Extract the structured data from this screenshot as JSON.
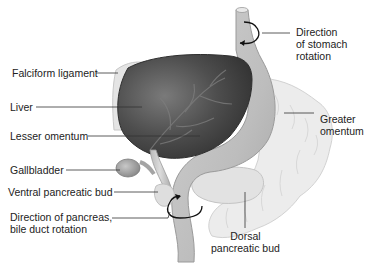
{
  "diagram": {
    "colors": {
      "liver": "#4a4a4a",
      "organ_tissue": "#c9c9c9",
      "omentum": "#e6e6e6",
      "leader_line": "#333333",
      "text": "#222222"
    },
    "labels": {
      "falciform_ligament": "Falciform ligament",
      "liver": "Liver",
      "lesser_omentum": "Lesser omentum",
      "gallbladder": "Gallbladder",
      "ventral_pancreatic_bud": "Ventral pancreatic bud",
      "direction_pancreas": "Direction of pancreas,\nbile duct rotation",
      "direction_stomach": "Direction\nof stomach\nrotation",
      "greater_omentum": "Greater\nomentum",
      "dorsal_pancreatic_bud": "Dorsal\npancreatic bud"
    },
    "icons": {
      "stomach_rotation_arrow": "curved-arrow-icon",
      "pancreas_rotation_arrow": "curved-arrow-icon"
    }
  }
}
